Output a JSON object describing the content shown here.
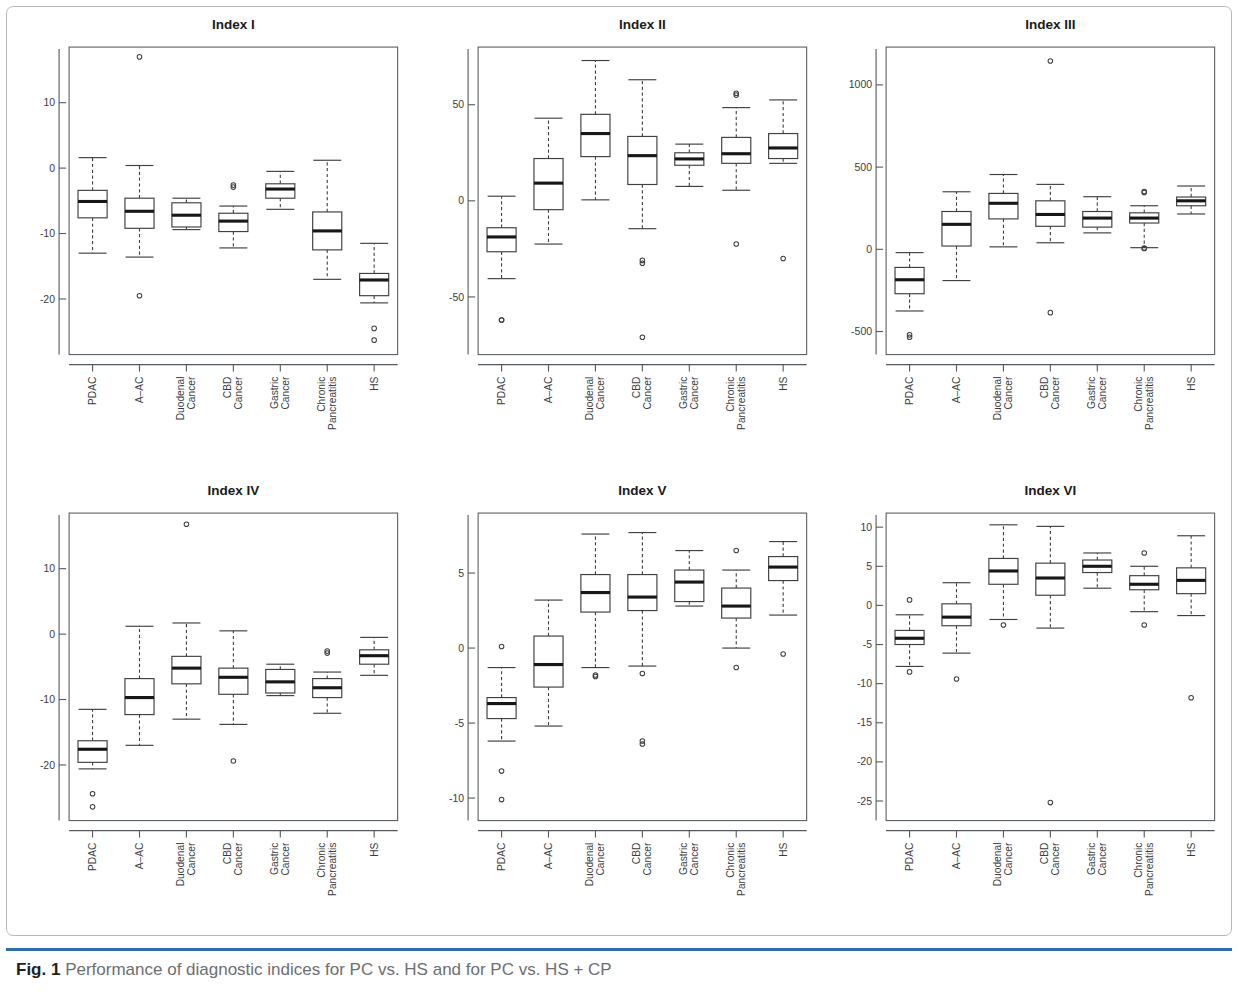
{
  "figure": {
    "caption_label": "Fig. 1",
    "caption_text": " Performance of diagnostic indices for PC vs. HS and for PC vs. HS + CP",
    "accent_color": "#2f6fa8",
    "line_color": "#3d3f42",
    "median_color": "#171717"
  },
  "categories": [
    "PDAC",
    "A–AC",
    "Duodenal Cancer",
    "CBD Cancer",
    "Gastric Cancer",
    "Chronic Pancreatitis",
    "HS"
  ],
  "chart_data": [
    {
      "type": "box",
      "title": "Index I",
      "xlabel": "",
      "ylabel": "",
      "ylim": [
        -28.5,
        18.5
      ],
      "yticks": [
        10,
        0,
        -10,
        -20
      ],
      "ytick_labels": [
        "10",
        "0",
        "-10",
        "-20"
      ],
      "grid": false,
      "legend": "none",
      "categories": [
        "PDAC",
        "A–AC",
        "Duodenal Cancer",
        "CBD Cancer",
        "Gastric Cancer",
        "Chronic Pancreatitis",
        "HS"
      ],
      "boxes": [
        {
          "category": "PDAC",
          "min": -13.0,
          "q1": -7.6,
          "median": -5.1,
          "q3": -3.4,
          "max": 1.6,
          "outliers": []
        },
        {
          "category": "A–AC",
          "min": -13.6,
          "q1": -9.2,
          "median": -6.6,
          "q3": -4.6,
          "max": 0.4,
          "outliers": [
            17.0,
            -19.5
          ]
        },
        {
          "category": "Duodenal Cancer",
          "min": -9.4,
          "q1": -9.0,
          "median": -7.2,
          "q3": -5.3,
          "max": -4.6,
          "outliers": []
        },
        {
          "category": "CBD Cancer",
          "min": -12.2,
          "q1": -9.7,
          "median": -8.1,
          "q3": -6.9,
          "max": -5.8,
          "outliers": [
            -2.6,
            -2.9
          ]
        },
        {
          "category": "Gastric Cancer",
          "min": -6.3,
          "q1": -4.6,
          "median": -3.2,
          "q3": -2.4,
          "max": -0.5,
          "outliers": []
        },
        {
          "category": "Chronic Pancreatitis",
          "min": -17.0,
          "q1": -12.5,
          "median": -9.6,
          "q3": -6.7,
          "max": 1.2,
          "outliers": []
        },
        {
          "category": "HS",
          "min": -20.6,
          "q1": -19.5,
          "median": -17.1,
          "q3": -16.1,
          "max": -11.5,
          "outliers": [
            -24.5,
            -26.3
          ]
        }
      ]
    },
    {
      "type": "box",
      "title": "Index II",
      "xlabel": "",
      "ylabel": "",
      "ylim": [
        -80,
        80
      ],
      "yticks": [
        50,
        0,
        -50
      ],
      "ytick_labels": [
        "50",
        "0",
        "-50"
      ],
      "grid": false,
      "legend": "none",
      "categories": [
        "PDAC",
        "A–AC",
        "Duodenal Cancer",
        "CBD Cancer",
        "Gastric Cancer",
        "Chronic Pancreatitis",
        "HS"
      ],
      "boxes": [
        {
          "category": "PDAC",
          "min": -40.5,
          "q1": -26.5,
          "median": -18.8,
          "q3": -14.0,
          "max": 2.4,
          "outliers": [
            -62.0,
            -62.0
          ]
        },
        {
          "category": "A–AC",
          "min": -22.5,
          "q1": -4.6,
          "median": 9.2,
          "q3": 22.0,
          "max": 43.0,
          "outliers": []
        },
        {
          "category": "Duodenal Cancer",
          "min": 0.5,
          "q1": 23.0,
          "median": 35.0,
          "q3": 45.0,
          "max": 73.0,
          "outliers": []
        },
        {
          "category": "CBD Cancer",
          "min": -14.5,
          "q1": 8.5,
          "median": 23.5,
          "q3": 33.5,
          "max": 63.0,
          "outliers": [
            -31.0,
            -32.5,
            -71.0
          ]
        },
        {
          "category": "Gastric Cancer",
          "min": 7.5,
          "q1": 18.5,
          "median": 21.8,
          "q3": 25.0,
          "max": 29.5,
          "outliers": []
        },
        {
          "category": "Chronic Pancreatitis",
          "min": 5.5,
          "q1": 19.5,
          "median": 24.5,
          "q3": 33.0,
          "max": 48.5,
          "outliers": [
            56.0,
            55.0,
            -22.5
          ]
        },
        {
          "category": "HS",
          "min": 19.5,
          "q1": 22.0,
          "median": 27.5,
          "q3": 35.0,
          "max": 52.5,
          "outliers": [
            -30.0
          ]
        }
      ]
    },
    {
      "type": "box",
      "title": "Index III",
      "xlabel": "",
      "ylabel": "",
      "ylim": [
        -640,
        1230
      ],
      "yticks": [
        1000,
        500,
        0,
        -500
      ],
      "ytick_labels": [
        "1000",
        "500",
        "0",
        "-500"
      ],
      "grid": false,
      "legend": "none",
      "categories": [
        "PDAC",
        "A–AC",
        "Duodenal Cancer",
        "CBD Cancer",
        "Gastric Cancer",
        "Chronic Pancreatitis",
        "HS"
      ],
      "boxes": [
        {
          "category": "PDAC",
          "min": -375,
          "q1": -270,
          "median": -185,
          "q3": -110,
          "max": -20,
          "outliers": [
            -520,
            -535
          ]
        },
        {
          "category": "A–AC",
          "min": -190,
          "q1": 20,
          "median": 152,
          "q3": 230,
          "max": 350,
          "outliers": []
        },
        {
          "category": "Duodenal Cancer",
          "min": 15,
          "q1": 185,
          "median": 280,
          "q3": 340,
          "max": 455,
          "outliers": []
        },
        {
          "category": "CBD Cancer",
          "min": 40,
          "q1": 140,
          "median": 212,
          "q3": 295,
          "max": 395,
          "outliers": [
            1145,
            -385
          ]
        },
        {
          "category": "Gastric Cancer",
          "min": 100,
          "q1": 135,
          "median": 190,
          "q3": 230,
          "max": 320,
          "outliers": []
        },
        {
          "category": "Chronic Pancreatitis",
          "min": 10,
          "q1": 160,
          "median": 190,
          "q3": 222,
          "max": 265,
          "outliers": [
            345,
            352,
            5,
            8
          ]
        },
        {
          "category": "HS",
          "min": 215,
          "q1": 265,
          "median": 295,
          "q3": 318,
          "max": 385,
          "outliers": []
        }
      ]
    },
    {
      "type": "box",
      "title": "Index IV",
      "xlabel": "",
      "ylabel": "",
      "ylim": [
        -28.5,
        18.5
      ],
      "yticks": [
        10,
        0,
        -10,
        -20
      ],
      "ytick_labels": [
        "10",
        "0",
        "-10",
        "-20"
      ],
      "grid": false,
      "legend": "none",
      "categories": [
        "PDAC",
        "A–AC",
        "Duodenal Cancer",
        "CBD Cancer",
        "Gastric Cancer",
        "Chronic Pancreatitis",
        "HS"
      ],
      "boxes": [
        {
          "category": "PDAC",
          "min": -20.6,
          "q1": -19.6,
          "median": -17.6,
          "q3": -16.3,
          "max": -11.5,
          "outliers": [
            -24.4,
            -26.4
          ]
        },
        {
          "category": "A–AC",
          "min": -17.0,
          "q1": -12.3,
          "median": -9.7,
          "q3": -6.8,
          "max": 1.2,
          "outliers": []
        },
        {
          "category": "Duodenal Cancer",
          "min": -13.0,
          "q1": -7.6,
          "median": -5.2,
          "q3": -3.4,
          "max": 1.7,
          "outliers": [
            16.8
          ]
        },
        {
          "category": "CBD Cancer",
          "min": -13.8,
          "q1": -9.2,
          "median": -6.6,
          "q3": -5.2,
          "max": 0.5,
          "outliers": [
            -19.4
          ]
        },
        {
          "category": "Gastric Cancer",
          "min": -9.4,
          "q1": -9.0,
          "median": -7.3,
          "q3": -5.4,
          "max": -4.6,
          "outliers": []
        },
        {
          "category": "Chronic Pancreatitis",
          "min": -12.1,
          "q1": -9.7,
          "median": -8.2,
          "q3": -6.8,
          "max": -5.8,
          "outliers": [
            -2.6,
            -2.9
          ]
        },
        {
          "category": "HS",
          "min": -6.3,
          "q1": -4.6,
          "median": -3.3,
          "q3": -2.4,
          "max": -0.5,
          "outliers": []
        }
      ]
    },
    {
      "type": "box",
      "title": "Index V",
      "xlabel": "",
      "ylabel": "",
      "ylim": [
        -11.5,
        9.0
      ],
      "yticks": [
        5,
        0,
        -5,
        -10
      ],
      "ytick_labels": [
        "5",
        "0",
        "-5",
        "-10"
      ],
      "grid": false,
      "legend": "none",
      "categories": [
        "PDAC",
        "A–AC",
        "Duodenal Cancer",
        "CBD Cancer",
        "Gastric Cancer",
        "Chronic Pancreatitis",
        "HS"
      ],
      "boxes": [
        {
          "category": "PDAC",
          "min": -6.2,
          "q1": -4.7,
          "median": -3.7,
          "q3": -3.3,
          "max": -1.3,
          "outliers": [
            0.1,
            -8.2,
            -10.1
          ]
        },
        {
          "category": "A–AC",
          "min": -5.2,
          "q1": -2.6,
          "median": -1.1,
          "q3": 0.8,
          "max": 3.2,
          "outliers": []
        },
        {
          "category": "Duodenal Cancer",
          "min": -1.3,
          "q1": 2.4,
          "median": 3.7,
          "q3": 4.9,
          "max": 7.6,
          "outliers": [
            -1.8,
            -1.9
          ]
        },
        {
          "category": "CBD Cancer",
          "min": -1.2,
          "q1": 2.5,
          "median": 3.4,
          "q3": 4.9,
          "max": 7.7,
          "outliers": [
            -1.7,
            -6.2,
            -6.4
          ]
        },
        {
          "category": "Gastric Cancer",
          "min": 2.8,
          "q1": 3.1,
          "median": 4.4,
          "q3": 5.2,
          "max": 6.5,
          "outliers": []
        },
        {
          "category": "Chronic Pancreatitis",
          "min": 0.0,
          "q1": 2.0,
          "median": 2.8,
          "q3": 4.0,
          "max": 5.2,
          "outliers": [
            6.5,
            -1.3
          ]
        },
        {
          "category": "HS",
          "min": 2.2,
          "q1": 4.5,
          "median": 5.4,
          "q3": 6.1,
          "max": 7.1,
          "outliers": [
            -0.4
          ]
        }
      ]
    },
    {
      "type": "box",
      "title": "Index VI",
      "xlabel": "",
      "ylabel": "",
      "ylim": [
        -27.5,
        11.8
      ],
      "yticks": [
        10,
        5,
        0,
        -5,
        -10,
        -15,
        -20,
        -25
      ],
      "ytick_labels": [
        "10",
        "5",
        "0",
        "-5",
        "-10",
        "-15",
        "-20",
        "-25"
      ],
      "grid": false,
      "legend": "none",
      "categories": [
        "PDAC",
        "A–AC",
        "Duodenal Cancer",
        "CBD Cancer",
        "Gastric Cancer",
        "Chronic Pancreatitis",
        "HS"
      ],
      "boxes": [
        {
          "category": "PDAC",
          "min": -7.8,
          "q1": -5.0,
          "median": -4.2,
          "q3": -3.2,
          "max": -1.2,
          "outliers": [
            0.7,
            -8.5
          ]
        },
        {
          "category": "A–AC",
          "min": -6.1,
          "q1": -2.6,
          "median": -1.5,
          "q3": 0.2,
          "max": 2.9,
          "outliers": [
            -9.4
          ]
        },
        {
          "category": "Duodenal Cancer",
          "min": -1.8,
          "q1": 2.7,
          "median": 4.4,
          "q3": 6.0,
          "max": 10.3,
          "outliers": [
            -2.5
          ]
        },
        {
          "category": "CBD Cancer",
          "min": -2.9,
          "q1": 1.3,
          "median": 3.5,
          "q3": 5.4,
          "max": 10.1,
          "outliers": [
            -25.2
          ]
        },
        {
          "category": "Gastric Cancer",
          "min": 2.2,
          "q1": 4.2,
          "median": 5.0,
          "q3": 5.8,
          "max": 6.7,
          "outliers": []
        },
        {
          "category": "Chronic Pancreatitis",
          "min": -0.8,
          "q1": 2.0,
          "median": 2.7,
          "q3": 3.8,
          "max": 5.0,
          "outliers": [
            6.7,
            -2.5
          ]
        },
        {
          "category": "HS",
          "min": -1.3,
          "q1": 1.5,
          "median": 3.2,
          "q3": 4.8,
          "max": 8.9,
          "outliers": [
            -11.8
          ]
        }
      ]
    }
  ]
}
